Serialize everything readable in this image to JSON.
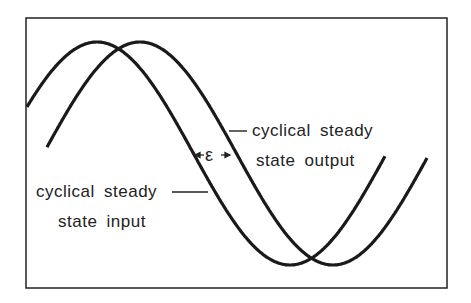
{
  "diagram": {
    "type": "phase-lag sinusoid diagram",
    "frame": {
      "x": 26,
      "y": 18,
      "width": 421,
      "height": 270,
      "stroke": "#222222"
    },
    "curve_color": "#1a1a1a",
    "curves": [
      {
        "name": "input",
        "label": "cyclical steady state input",
        "x_start": 27,
        "x_end": 385,
        "peak_x": 97,
        "center_y": 153.5,
        "amplitude": 111.5,
        "period": 386
      },
      {
        "name": "output",
        "label": "cyclical steady state output",
        "x_start": 47,
        "x_end": 427,
        "peak_x": 140,
        "center_y": 153.5,
        "amplitude": 111.5,
        "period": 386
      }
    ],
    "labels": {
      "output_line1": "cyclical  steady",
      "output_line2": "state  output",
      "input_line1": "cyclical  steady",
      "input_line2": "state  input",
      "phase_symbol": "ε"
    },
    "phase_marker": {
      "y": 156,
      "x_left": 192,
      "x_right": 232
    }
  }
}
